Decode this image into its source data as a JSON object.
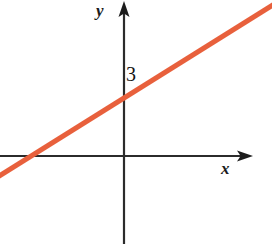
{
  "figure": {
    "width": 272,
    "height": 244,
    "background_color": "#ffffff"
  },
  "labels": {
    "x_axis": "x",
    "y_axis": "y",
    "y_intercept": "3"
  },
  "style": {
    "line_color": "#e8603c",
    "axis_color": "#2b2b2b",
    "text_color": "#141414",
    "line_width": 5,
    "axis_width": 2
  },
  "chart_data": {
    "type": "line",
    "title": "",
    "xlabel": "x",
    "ylabel": "y",
    "grid": false,
    "legend": null,
    "annotations": [
      "3"
    ],
    "series": [
      {
        "name": "line",
        "color": "#e8603c",
        "x": [
          -4.8,
          0,
          9.7
        ],
        "y": [
          0,
          3,
          9.4
        ],
        "slope": 0.625,
        "y_intercept": 3,
        "x_intercept": -4.8
      }
    ],
    "axes": {
      "x_origin_px": 124,
      "y_origin_px": 156,
      "x_range_px": [
        0,
        252
      ],
      "y_range_px": [
        2,
        244
      ]
    }
  }
}
